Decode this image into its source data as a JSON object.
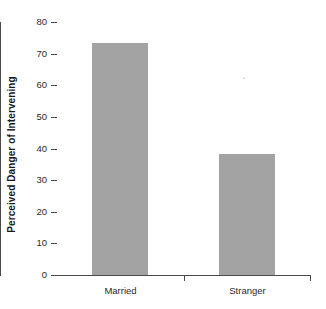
{
  "chart_data": {
    "type": "bar",
    "title": "",
    "xlabel": "",
    "ylabel": "Perceived Danger of Intervening",
    "categories": [
      "Married",
      "Stranger"
    ],
    "values": [
      73.5,
      38.3
    ],
    "ylim": [
      0,
      80
    ],
    "ytick_labels": [
      "0",
      "10",
      "20",
      "30",
      "40",
      "50",
      "60",
      "70",
      "80"
    ],
    "ytick_values": [
      0,
      10,
      20,
      30,
      40,
      50,
      60,
      70,
      80
    ],
    "grid": false,
    "legend": false,
    "bar_color": "#a3a3a3",
    "axis_color": "#4a4a4a",
    "background": "#ffffff"
  }
}
